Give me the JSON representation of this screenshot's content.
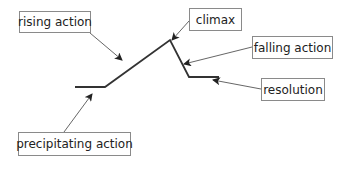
{
  "diagram": {
    "title": "",
    "type": "plot-structure (Freytag-style)",
    "plot_line": {
      "color": "#333333",
      "points": [
        [
          75,
          87
        ],
        [
          105,
          87
        ],
        [
          170,
          40
        ],
        [
          189,
          77
        ],
        [
          219,
          77
        ]
      ]
    },
    "arrow_color": "#555555",
    "labels": [
      {
        "id": "rising",
        "text": "rising action",
        "box": [
          19,
          11,
          72,
          22
        ],
        "arrow_from": [
          90,
          33
        ],
        "arrow_to": [
          122,
          60
        ]
      },
      {
        "id": "climax",
        "text": "climax",
        "box": [
          189,
          8,
          53,
          23
        ],
        "arrow_from": [
          189,
          21
        ],
        "arrow_to": [
          172,
          40
        ]
      },
      {
        "id": "falling",
        "text": "falling action",
        "box": [
          252,
          36,
          81,
          23
        ],
        "arrow_from": [
          252,
          47
        ],
        "arrow_to": [
          184,
          64
        ]
      },
      {
        "id": "resolution",
        "text": "resolution",
        "box": [
          261,
          78,
          64,
          23
        ],
        "arrow_from": [
          261,
          89
        ],
        "arrow_to": [
          213,
          80
        ]
      },
      {
        "id": "precipitating",
        "text": "precipitating action",
        "box": [
          18,
          132,
          113,
          24
        ],
        "arrow_from": [
          64,
          132
        ],
        "arrow_to": [
          92,
          94
        ]
      }
    ]
  }
}
